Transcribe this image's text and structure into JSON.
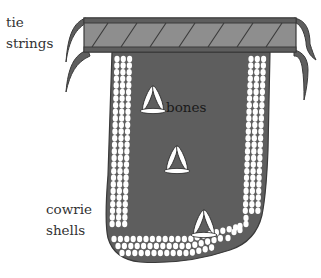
{
  "diagram": {
    "labels": {
      "tie_strings": [
        "tie",
        "strings"
      ],
      "bones": "bones",
      "cowrie_shells": [
        "cowrie",
        "shells"
      ]
    },
    "colors": {
      "body": "#5e5e5e",
      "band_fill": "#8e8e8e",
      "outline": "#3a3a3a",
      "shell": "#ffffff",
      "bone": "#ffffff",
      "text": "#333333"
    },
    "parts": [
      "waistband",
      "tie-strings",
      "apron-body",
      "cowrie-shell-border",
      "bone-ornaments"
    ]
  }
}
